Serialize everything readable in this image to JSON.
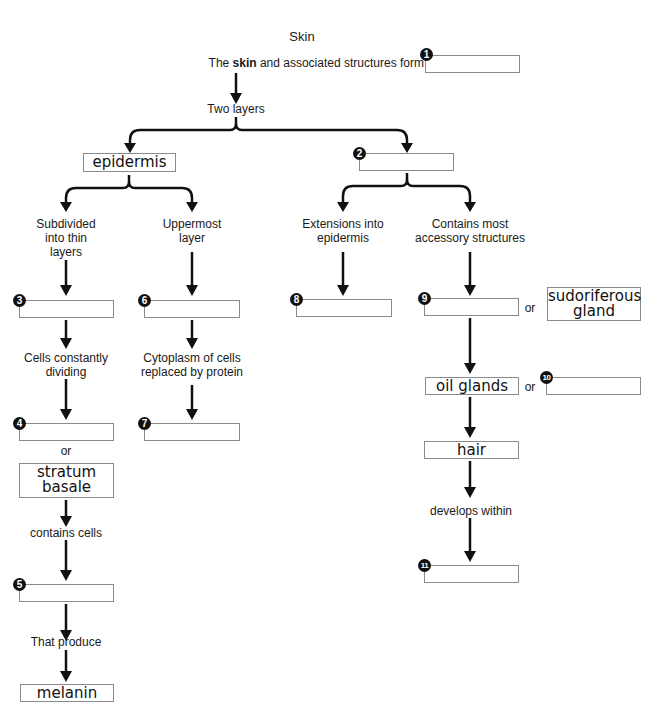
{
  "title": "Skin",
  "intro": {
    "prefix": "The ",
    "bold": "skin",
    "suffix": " and associated structures form"
  },
  "labels": {
    "two_layers": "Two layers",
    "subdivided": [
      "Subdivided",
      "into thin",
      "layers"
    ],
    "uppermost": [
      "Uppermost",
      "layer"
    ],
    "extensions": [
      "Extensions into",
      "epidermis"
    ],
    "contains_most": [
      "Contains most",
      "accessory structures"
    ],
    "cells_dividing": [
      "Cells constantly",
      "dividing"
    ],
    "cytoplasm": [
      "Cytoplasm of cells",
      "replaced by protein"
    ],
    "or": "or",
    "contains_cells": "contains cells",
    "that_produce": "That produce",
    "develops_within": "develops within"
  },
  "filled": {
    "epidermis": "epidermis",
    "stratum_basale": [
      "stratum",
      "basale"
    ],
    "melanin": "melanin",
    "sudoriferous": [
      "sudoriferous",
      "gland"
    ],
    "oil_glands": "oil glands",
    "hair": "hair"
  },
  "blanks": [
    {
      "num": "1",
      "value": ""
    },
    {
      "num": "2",
      "value": ""
    },
    {
      "num": "3",
      "value": ""
    },
    {
      "num": "4",
      "value": ""
    },
    {
      "num": "5",
      "value": ""
    },
    {
      "num": "6",
      "value": ""
    },
    {
      "num": "7",
      "value": ""
    },
    {
      "num": "8",
      "value": ""
    },
    {
      "num": "9",
      "value": ""
    },
    {
      "num": "10",
      "value": ""
    },
    {
      "num": "11",
      "value": ""
    }
  ]
}
